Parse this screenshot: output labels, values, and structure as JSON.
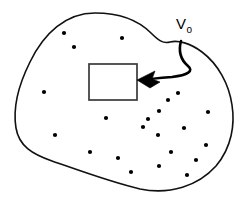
{
  "figure": {
    "background_color": "#ffffff",
    "width": 251,
    "height": 199
  },
  "annotation": {
    "label_base": "V",
    "label_subscript": "o",
    "label_full": "Vo",
    "label_x": 176,
    "label_y": 29,
    "color": "#000000",
    "arrow_name": "curved-pointer-arrow",
    "arrow_tip_x": 138,
    "arrow_tip_y": 80
  },
  "region_outline": {
    "name": "fluid-region-blob",
    "stroke_color": "#111111",
    "fill_color": "#ffffff",
    "stroke_width": 1.6,
    "path": "M 95 13 C 66 13 44 33 30 62 C 18 86 13 110 16 128 C 19 146 32 154 52 161 C 78 170 110 182 140 189 C 170 195 198 186 216 166 C 232 147 235 124 232 105 C 229 84 218 64 202 52 C 190 43 178 40 170 42 C 163 44 158 40 151 33 C 138 20 118 13 95 13 Z"
  },
  "sub_volume": {
    "name": "control-volume-rectangle",
    "x": 89,
    "y": 64,
    "width": 48,
    "height": 36,
    "stroke_color": "#3a3a3a",
    "fill_color": "#ffffff"
  },
  "particles": {
    "name": "fluid-particles",
    "color": "#000000",
    "radius": 2.1,
    "count": 22,
    "points": [
      {
        "x": 64,
        "y": 33
      },
      {
        "x": 74,
        "y": 47
      },
      {
        "x": 122,
        "y": 38
      },
      {
        "x": 44,
        "y": 92
      },
      {
        "x": 178,
        "y": 93
      },
      {
        "x": 106,
        "y": 118
      },
      {
        "x": 159,
        "y": 111
      },
      {
        "x": 208,
        "y": 112
      },
      {
        "x": 143,
        "y": 127
      },
      {
        "x": 184,
        "y": 128
      },
      {
        "x": 158,
        "y": 135
      },
      {
        "x": 55,
        "y": 135
      },
      {
        "x": 90,
        "y": 152
      },
      {
        "x": 206,
        "y": 145
      },
      {
        "x": 171,
        "y": 152
      },
      {
        "x": 131,
        "y": 172
      },
      {
        "x": 159,
        "y": 166
      },
      {
        "x": 187,
        "y": 175
      },
      {
        "x": 118,
        "y": 158
      },
      {
        "x": 196,
        "y": 160
      },
      {
        "x": 148,
        "y": 119
      },
      {
        "x": 168,
        "y": 100
      }
    ]
  },
  "chart_data": {
    "type": "diagram",
    "elements": [
      "closed irregular fluid region boundary",
      "interior rectangle representing control volume Vo",
      "scattered point particles throughout the region",
      "curved arrow annotation pointing from the Vo label to the rectangle"
    ],
    "labels": [
      "Vo"
    ]
  }
}
